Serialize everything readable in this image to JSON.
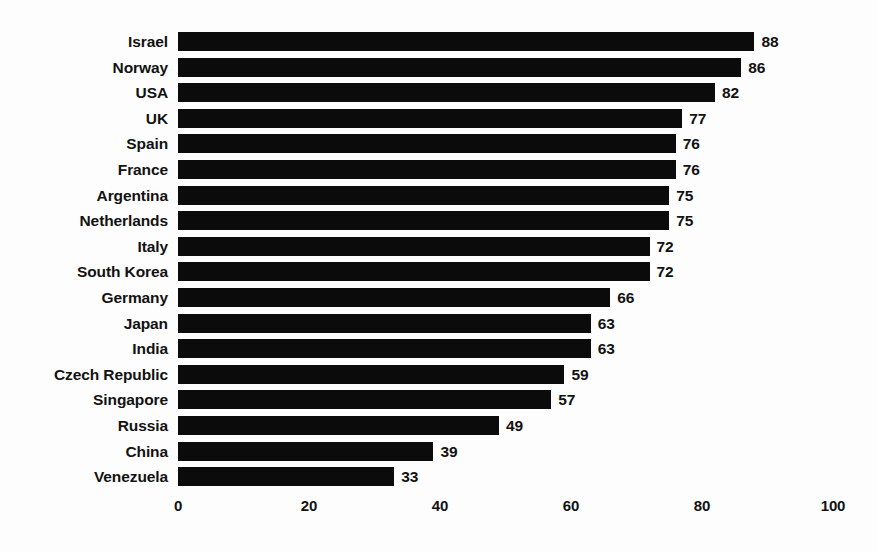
{
  "chart_data": {
    "type": "bar",
    "orientation": "horizontal",
    "title": "",
    "subtitle": "",
    "xlabel": "",
    "ylabel": "",
    "xlim": [
      0,
      100
    ],
    "xticks": [
      0,
      20,
      40,
      60,
      80,
      100
    ],
    "xtick_labels": [
      "0",
      "20",
      "40",
      "60",
      "80",
      "100"
    ],
    "grid": false,
    "legend": null,
    "bar_color": "#0b0b0b",
    "background_color": "#fdfdfd",
    "text_color": "#121212",
    "value_labels_shown": true,
    "categories": [
      "Israel",
      "Norway",
      "USA",
      "UK",
      "Spain",
      "France",
      "Argentina",
      "Netherlands",
      "Italy",
      "South Korea",
      "Germany",
      "Japan",
      "India",
      "Czech Republic",
      "Singapore",
      "Russia",
      "China",
      "Venezuela"
    ],
    "values": [
      88,
      86,
      82,
      77,
      76,
      76,
      75,
      75,
      72,
      72,
      66,
      63,
      63,
      59,
      57,
      49,
      39,
      33
    ],
    "value_labels": [
      "88",
      "86",
      "82",
      "77",
      "76",
      "76",
      "75",
      "75",
      "72",
      "72",
      "66",
      "63",
      "63",
      "59",
      "57",
      "49",
      "39",
      "33"
    ]
  }
}
